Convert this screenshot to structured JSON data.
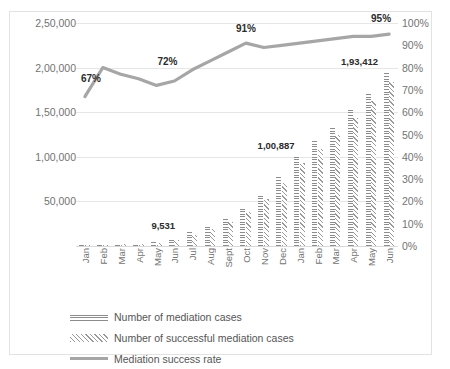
{
  "chart_data": {
    "type": "bar",
    "title": "",
    "subtitle": "",
    "xlabel": "",
    "ylabel": "",
    "y2label": "",
    "grid": true,
    "legend_position": "bottom-left",
    "categories": [
      "Jan",
      "Feb",
      "Mar",
      "Apr",
      "May",
      "Jun",
      "Jul",
      "Aug",
      "Sept",
      "Oct",
      "Nov",
      "Dec",
      "Jan",
      "Feb",
      "Mar",
      "Apr",
      "May",
      "Jun"
    ],
    "left_axis": {
      "ticks": [
        "0",
        "50,000",
        "1,00,000",
        "1,50,000",
        "2,00,000",
        "2,50,000"
      ],
      "values": [
        0,
        50000,
        100000,
        150000,
        200000,
        250000
      ],
      "ylim": [
        0,
        250000
      ]
    },
    "right_axis": {
      "ticks": [
        "0%",
        "10%",
        "20%",
        "30%",
        "40%",
        "50%",
        "60%",
        "70%",
        "80%",
        "90%",
        "100%"
      ],
      "values": [
        0,
        10,
        20,
        30,
        40,
        50,
        60,
        70,
        80,
        90,
        100
      ],
      "ylim": [
        0,
        100
      ]
    },
    "series": [
      {
        "name": "Number of mediation cases",
        "axis": "left",
        "type": "bar",
        "pattern": "horizontal-hatch",
        "values": [
          900,
          1600,
          2500,
          3600,
          5200,
          9531,
          16000,
          23000,
          32000,
          44000,
          58000,
          78000,
          100887,
          118000,
          134000,
          152000,
          172000,
          193412
        ]
      },
      {
        "name": "Number of successful mediation cases",
        "axis": "left",
        "type": "bar",
        "pattern": "diagonal-hatch",
        "values": [
          600,
          1280,
          1900,
          2800,
          3750,
          7050,
          12500,
          18800,
          26900,
          38200,
          52800,
          71000,
          92800,
          109000,
          125000,
          143000,
          163000,
          183740
        ]
      },
      {
        "name": "Mediation success rate",
        "axis": "right",
        "type": "line",
        "color": "#a6a6a6",
        "values": [
          67,
          80,
          77,
          75,
          72,
          74,
          79,
          83,
          87,
          91,
          89,
          90,
          91,
          92,
          93,
          94,
          94,
          95
        ]
      }
    ],
    "annotations": [
      {
        "text": "67%",
        "series": "Mediation success rate",
        "category": "Jan"
      },
      {
        "text": "72%",
        "series": "Mediation success rate",
        "category": "May"
      },
      {
        "text": "91%",
        "series": "Mediation success rate",
        "category": "Oct"
      },
      {
        "text": "95%",
        "series": "Mediation success rate",
        "category": "Jun"
      },
      {
        "text": "9,531",
        "series": "Number of mediation cases",
        "category": "Jun"
      },
      {
        "text": "1,00,887",
        "series": "Number of mediation cases",
        "category": "Jan"
      },
      {
        "text": "1,93,412",
        "series": "Number of mediation cases",
        "category": "Jun"
      }
    ]
  },
  "legend": {
    "items": [
      {
        "label": "Number of mediation cases",
        "key": "horizontal-hatch"
      },
      {
        "label": "Number of successful mediation cases",
        "key": "diagonal-hatch"
      },
      {
        "label": "Mediation success rate",
        "key": "line"
      }
    ]
  },
  "colors": {
    "line": "#a6a6a6",
    "bar": "#8c8c8c",
    "grid": "#e6e6e6",
    "axis_text": "#737373",
    "label_text": "#2b2b2b",
    "frame": "#e2e2e2"
  }
}
